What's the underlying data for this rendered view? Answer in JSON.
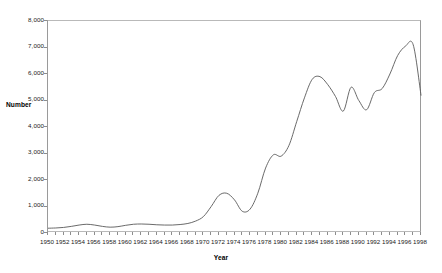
{
  "chart_data": {
    "type": "line",
    "title": "",
    "xlabel": "Year",
    "ylabel": "Number",
    "xlim": [
      1950,
      1998
    ],
    "ylim": [
      0,
      8000
    ],
    "grid": false,
    "legend": false,
    "y_ticks": [
      0,
      1000,
      2000,
      3000,
      4000,
      5000,
      6000,
      7000,
      8000
    ],
    "y_tick_labels": [
      "0",
      "1,000",
      "2,000",
      "3,000",
      "4,000",
      "5,000",
      "6,000",
      "7,000",
      "8,000"
    ],
    "x_tick_labels": [
      "1950",
      "1952",
      "1954",
      "1956",
      "1958",
      "1960",
      "1962",
      "1964",
      "1966",
      "1968",
      "1970",
      "1972",
      "1974",
      "1976",
      "1978",
      "1980",
      "1982",
      "1984",
      "1986",
      "1988",
      "1990",
      "1992",
      "1994",
      "1996",
      "1998"
    ],
    "x_tick_step": 2,
    "x_minor_tick_step": 1,
    "series": [
      {
        "name": "Number",
        "color": "#595959",
        "x": [
          1950,
          1951,
          1952,
          1953,
          1954,
          1955,
          1956,
          1957,
          1958,
          1959,
          1960,
          1961,
          1962,
          1963,
          1964,
          1965,
          1966,
          1967,
          1968,
          1969,
          1970,
          1971,
          1972,
          1973,
          1974,
          1975,
          1976,
          1977,
          1978,
          1979,
          1980,
          1981,
          1982,
          1983,
          1984,
          1985,
          1986,
          1987,
          1988,
          1989,
          1990,
          1991,
          1992,
          1993,
          1994,
          1995,
          1996,
          1997,
          1998
        ],
        "values": [
          180,
          190,
          210,
          250,
          300,
          330,
          300,
          250,
          220,
          240,
          290,
          330,
          340,
          330,
          310,
          300,
          300,
          320,
          360,
          450,
          620,
          1000,
          1420,
          1500,
          1250,
          820,
          900,
          1500,
          2450,
          2950,
          2900,
          3300,
          4200,
          5100,
          5800,
          5900,
          5600,
          5150,
          4600,
          5500,
          5000,
          4650,
          5300,
          5450,
          6000,
          6700,
          7050,
          7100,
          5200
        ]
      }
    ]
  }
}
